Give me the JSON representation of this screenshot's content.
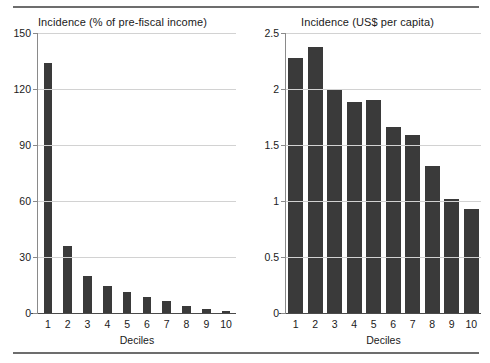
{
  "chart_data": [
    {
      "type": "bar",
      "title": "Incidence (% of pre-fiscal income)",
      "xlabel": "Deciles",
      "ylabel": "",
      "categories": [
        "1",
        "2",
        "3",
        "4",
        "5",
        "6",
        "7",
        "8",
        "9",
        "10"
      ],
      "values": [
        134,
        36,
        20,
        14.5,
        11.5,
        8.5,
        6.5,
        4,
        2.3,
        1
      ],
      "ylim": [
        0,
        150
      ],
      "yticks": [
        0,
        30,
        60,
        90,
        120,
        150
      ],
      "ytick_labels": [
        "0",
        "30",
        "60",
        "90",
        "120",
        "150"
      ],
      "grid": true,
      "legend": "none",
      "bar_color": "#3a3a3a"
    },
    {
      "type": "bar",
      "title": "Incidence (US$ per capita)",
      "xlabel": "Deciles",
      "ylabel": "",
      "categories": [
        "1",
        "2",
        "3",
        "4",
        "5",
        "6",
        "7",
        "8",
        "9",
        "10"
      ],
      "values": [
        2.28,
        2.375,
        2.0,
        1.885,
        1.9,
        1.665,
        1.59,
        1.31,
        1.015,
        0.93
      ],
      "ylim": [
        0,
        2.5
      ],
      "yticks": [
        0,
        0.5,
        1,
        1.5,
        2,
        2.5
      ],
      "ytick_labels": [
        "0",
        "0.5",
        "1",
        "1.5",
        "2",
        "2.5"
      ],
      "grid": true,
      "legend": "none",
      "bar_color": "#3a3a3a"
    }
  ]
}
